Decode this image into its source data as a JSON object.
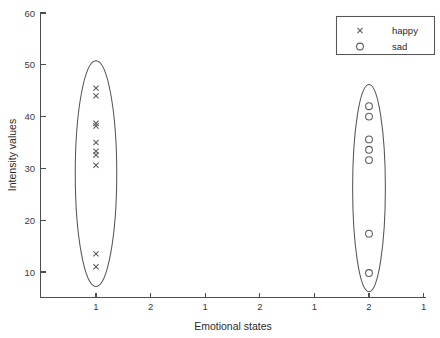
{
  "chart_data": {
    "type": "scatter",
    "title": "",
    "xlabel": "Emotional states",
    "ylabel": "Intensity values",
    "ylim": [
      6,
      60
    ],
    "xlim": [
      0,
      7.6
    ],
    "grid": false,
    "legend_position": "top-right",
    "y_ticks": [
      60,
      50,
      40,
      30,
      20,
      10
    ],
    "y_tick_labels": [
      "60",
      "50",
      "40",
      "30",
      "20",
      "10"
    ],
    "x_ticks": [
      1,
      2,
      3,
      4,
      5,
      6,
      7
    ],
    "x_tick_labels": [
      "1",
      "2",
      "1",
      "2",
      "1",
      "2",
      "1"
    ],
    "series": [
      {
        "name": "happy",
        "marker": "x",
        "x_category": "1",
        "x_tick_index": 1,
        "values": [
          45.5,
          44.0,
          38.7,
          38.2,
          35.0,
          33.3,
          32.6,
          30.6,
          13.5,
          11.0
        ],
        "count": 10
      },
      {
        "name": "sad",
        "marker": "o",
        "x_category": "2",
        "x_tick_index": 6,
        "values": [
          42.0,
          40.0,
          35.6,
          33.6,
          31.6,
          17.4,
          9.8
        ],
        "count": 7
      }
    ],
    "annotations": [
      {
        "type": "ellipse",
        "label": "happy-cluster-ellipse",
        "center_x_tick_index": 1,
        "center_value": 29.0,
        "half_width_ticks": 0.38,
        "half_height_value": 21.8
      },
      {
        "type": "ellipse",
        "label": "sad-cluster-ellipse",
        "center_x_tick_index": 6,
        "center_value": 26.2,
        "half_width_ticks": 0.3,
        "half_height_value": 20.0
      }
    ]
  },
  "legend": {
    "entries": [
      {
        "label": "happy",
        "marker": "x"
      },
      {
        "label": "sad",
        "marker": "o"
      }
    ]
  },
  "axes": {
    "x_title": "Emotional states",
    "y_title": "Intensity values"
  },
  "colors": {
    "axis": "#4d4d4d",
    "marker": "#5a5a5a",
    "ellipse": "#555555",
    "text": "#2b2b2b",
    "background": "#ffffff"
  }
}
